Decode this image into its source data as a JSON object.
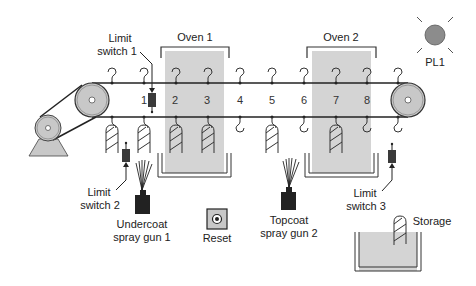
{
  "labels": {
    "limit_switch_1": [
      "Limit",
      "switch 1"
    ],
    "limit_switch_2": [
      "Limit",
      "switch 2"
    ],
    "limit_switch_3": [
      "Limit",
      "switch 3"
    ],
    "oven_1": "Oven 1",
    "oven_2": "Oven 2",
    "pilot_light": "PL1",
    "undercoat_gun": [
      "Undercoat",
      "spray gun 1"
    ],
    "topcoat_gun": [
      "Topcoat",
      "spray gun 2"
    ],
    "reset": "Reset",
    "storage": "Storage"
  },
  "positions": [
    "1",
    "2",
    "3",
    "4",
    "5",
    "6",
    "7",
    "8"
  ],
  "colors": {
    "oven_fill": "#d4d4d4",
    "pulley_fill": "#c8c8c8",
    "lamp_fill": "#8c8c8c",
    "switch_fill": "#3a3a3a",
    "gun_fill": "#222222",
    "line": "#222222"
  }
}
